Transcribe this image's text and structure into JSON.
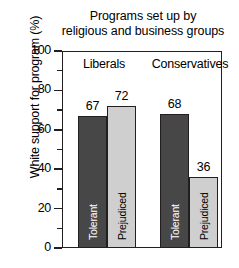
{
  "chart_data": {
    "type": "bar",
    "title": "Programs set up by\nreligious and business groups",
    "xlabel": "",
    "ylabel": "White support for program (%)",
    "ylim": [
      0,
      100
    ],
    "ytick_labels": [
      "100",
      "80",
      "60",
      "40",
      "20",
      "0"
    ],
    "ytick_values": [
      100,
      80,
      60,
      40,
      20,
      0
    ],
    "minor_tick_values": [
      90,
      70,
      50,
      30,
      10
    ],
    "grid": false,
    "legend": "none (bars labelled in place)",
    "groups": [
      "Liberals",
      "Conservatives"
    ],
    "categories": [
      "Tolerant",
      "Prejudiced"
    ],
    "series": [
      {
        "name": "Tolerant",
        "values": [
          67,
          68
        ],
        "color": "#474747"
      },
      {
        "name": "Prejudiced",
        "values": [
          72,
          36
        ],
        "color": "#cfcfcf"
      }
    ],
    "bars": [
      {
        "group": "Liberals",
        "category": "Tolerant",
        "value": 67,
        "label": "67",
        "inner_label": "Tolerant",
        "style": "dark"
      },
      {
        "group": "Liberals",
        "category": "Prejudiced",
        "value": 72,
        "label": "72",
        "inner_label": "Prejudiced",
        "style": "light"
      },
      {
        "group": "Conservatives",
        "category": "Tolerant",
        "value": 68,
        "label": "68",
        "inner_label": "Tolerant",
        "style": "dark"
      },
      {
        "group": "Conservatives",
        "category": "Prejudiced",
        "value": 36,
        "label": "36",
        "inner_label": "Prejudiced",
        "style": "light"
      }
    ],
    "colors": {
      "dark_bar": "#474747",
      "light_bar": "#cfcfcf",
      "axis": "#231f20",
      "background": "#ffffff",
      "text": "#000000"
    }
  }
}
